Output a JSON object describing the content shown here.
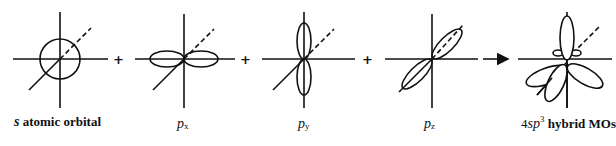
{
  "figure": {
    "panels": [
      {
        "id": "s",
        "label_italic": "s",
        "label_rest": " atomic orbital"
      },
      {
        "id": "px",
        "label_italic": "p",
        "label_sub": "x"
      },
      {
        "id": "py",
        "label_italic": "p",
        "label_sub": "y"
      },
      {
        "id": "pz",
        "label_italic": "p",
        "label_sub": "z"
      },
      {
        "id": "hybrid",
        "label_prefix": "4",
        "label_italic": "sp",
        "label_sup": "3",
        "label_rest": " hybrid MOs"
      }
    ],
    "operators": [
      "+",
      "+",
      "+"
    ],
    "result_arrow": "right-arrow"
  }
}
